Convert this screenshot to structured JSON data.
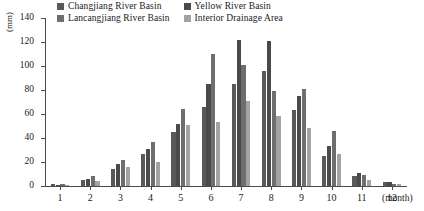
{
  "chart_data": {
    "type": "bar",
    "title": "",
    "xlabel": "(month)",
    "ylabel": "(mm)",
    "ylim": [
      0,
      140
    ],
    "yticks": [
      0,
      20,
      40,
      60,
      80,
      100,
      120,
      140
    ],
    "grid": false,
    "legend_position": "top",
    "categories": [
      "1",
      "2",
      "3",
      "4",
      "5",
      "6",
      "7",
      "8",
      "9",
      "10",
      "11",
      "12"
    ],
    "series": [
      {
        "name": "Changjiang River Basin",
        "color": "#595959",
        "values": [
          2,
          5,
          14,
          27,
          45,
          66,
          85,
          96,
          63,
          25,
          8,
          3
        ]
      },
      {
        "name": "Yellow River Basin",
        "color": "#4a4a4a",
        "values": [
          1,
          6,
          18,
          31,
          52,
          85,
          122,
          121,
          75,
          33,
          11,
          3
        ]
      },
      {
        "name": "Lancangjiang River Basin",
        "color": "#6e6e6e",
        "values": [
          2,
          8,
          22,
          37,
          64,
          110,
          101,
          79,
          81,
          46,
          9,
          2
        ]
      },
      {
        "name": "Interior Drainage Area",
        "color": "#a3a3a3",
        "values": [
          1,
          4,
          16,
          20,
          51,
          53,
          71,
          58,
          48,
          27,
          5,
          2
        ]
      }
    ]
  },
  "legend": {
    "items": [
      {
        "label": "Changjiang River Basin",
        "color": "#595959"
      },
      {
        "label": "Yellow River Basin",
        "color": "#4a4a4a"
      },
      {
        "label": "Lancangjiang River Basin",
        "color": "#6e6e6e"
      },
      {
        "label": "Interior Drainage Area",
        "color": "#a3a3a3"
      }
    ]
  },
  "axes": {
    "y_title": "(mm)",
    "x_title": "(month)",
    "y_tick_labels": [
      "0",
      "20",
      "40",
      "60",
      "80",
      "100",
      "120",
      "140"
    ],
    "x_tick_labels": [
      "1",
      "2",
      "3",
      "4",
      "5",
      "6",
      "7",
      "8",
      "9",
      "10",
      "11",
      "12"
    ]
  }
}
